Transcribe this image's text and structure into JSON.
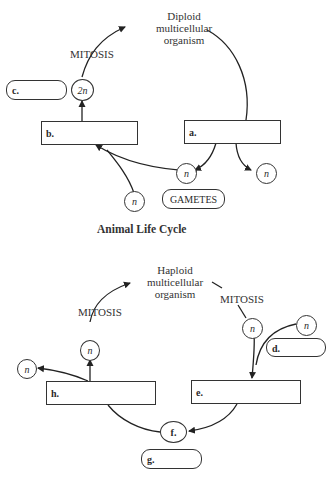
{
  "animal": {
    "organism_label": [
      "Diploid",
      "multicellular",
      "organism"
    ],
    "mitosis_label": "MITOSIS",
    "diploid_cell": "2n",
    "haploid_cell": "n",
    "gametes_label": "GAMETES",
    "boxes": {
      "a": "a.",
      "b": "b.",
      "c": "c."
    },
    "caption": "Animal Life Cycle"
  },
  "alternation": {
    "organism_label": [
      "Haploid",
      "multicellular",
      "organism"
    ],
    "mitosis_left": "MITOSIS",
    "mitosis_right": "MITOSIS",
    "haploid_cell": "n",
    "boxes": {
      "d": "d.",
      "e": "e.",
      "f": "f.",
      "g": "g.",
      "h": "h."
    }
  }
}
